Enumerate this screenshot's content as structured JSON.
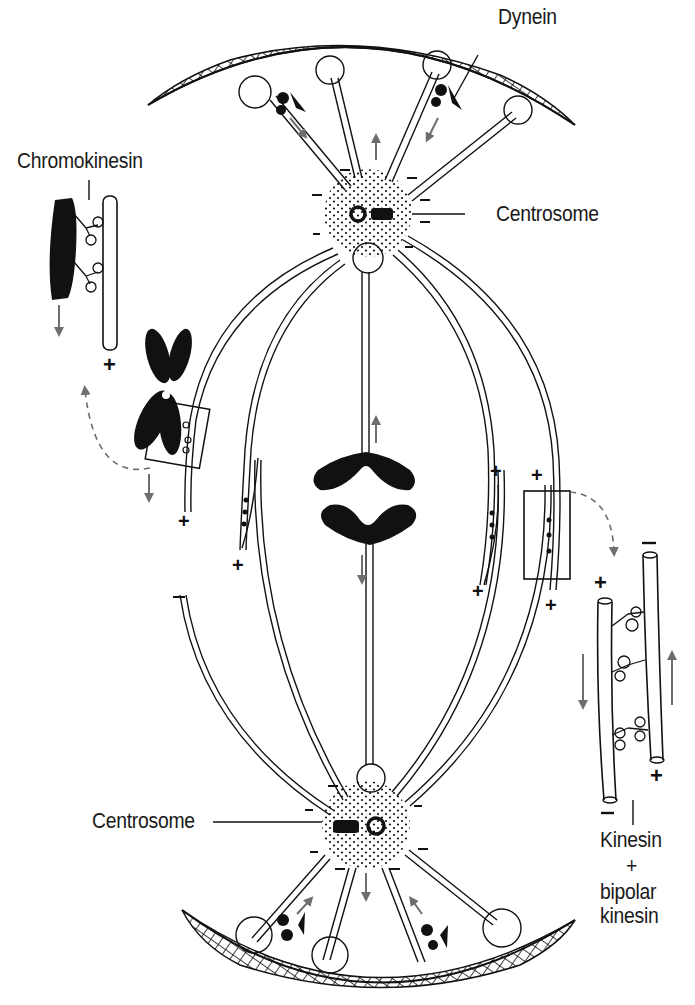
{
  "diagram": {
    "colors": {
      "ink": "#111111",
      "arrow_gray": "#6e6e6e",
      "background": "#ffffff"
    },
    "labels": {
      "dynein": "Dynein",
      "chromokinesin": "Chromokinesin",
      "centrosome_top": "Centrosome",
      "centrosome_bottom": "Centrosome",
      "kinesin_line1": "Kinesin",
      "kinesin_line2": "+",
      "kinesin_line3": "bipolar",
      "kinesin_line4": "kinesin"
    },
    "polarity_marks": {
      "plus": "+",
      "minus": "−"
    },
    "components": [
      {
        "name": "cell cortex (top)",
        "type": "crosshatched arc"
      },
      {
        "name": "cell cortex (bottom)",
        "type": "crosshatched arc"
      },
      {
        "name": "centrosome (top)",
        "type": "stippled circle with centrioles"
      },
      {
        "name": "centrosome (bottom)",
        "type": "stippled circle with centrioles"
      },
      {
        "name": "astral microtubules",
        "type": "double-line rods to cortex"
      },
      {
        "name": "kinetochore microtubules",
        "type": "double-line rods"
      },
      {
        "name": "polar microtubules",
        "type": "double-line curved rods"
      },
      {
        "name": "chromosome (X-shaped)",
        "type": "filled shape"
      },
      {
        "name": "separating chromatids",
        "type": "V-shaped filled shapes"
      },
      {
        "name": "chromokinesin inset",
        "type": "zoom detail"
      },
      {
        "name": "kinesin + bipolar kinesin inset",
        "type": "zoom detail"
      }
    ]
  }
}
